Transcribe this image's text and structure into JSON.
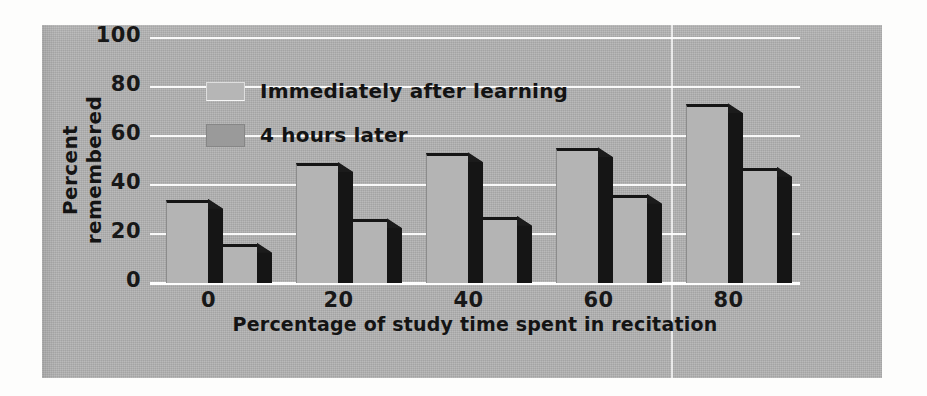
{
  "figure": {
    "background_color": "#b2b2b2",
    "page_color": "#fdfdfc"
  },
  "chart_data": {
    "type": "bar",
    "title": "",
    "xlabel": "Percentage of study time spent in recitation",
    "ylabel": "Percent remembered",
    "categories": [
      "0",
      "20",
      "40",
      "60",
      "80"
    ],
    "series": [
      {
        "name": "Immediately after learning",
        "values": [
          34,
          49,
          53,
          55,
          73
        ],
        "color": "#b4b4b4"
      },
      {
        "name": "4 hours later",
        "values": [
          16,
          26,
          27,
          36,
          47
        ],
        "color": "#b4b4b4"
      }
    ],
    "ylim": [
      0,
      100
    ],
    "yticks": [
      "0",
      "20",
      "40",
      "60",
      "80",
      "100"
    ],
    "ytick_values": [
      0,
      20,
      40,
      60,
      80,
      100
    ],
    "grid": true,
    "grid_color": "#ffffff",
    "legend_position": "upper left",
    "bar_style": "3d-extruded",
    "bar_shadow_color": "#151515"
  },
  "legend": {
    "entries": [
      {
        "label": "Immediately after learning",
        "swatch": "light"
      },
      {
        "label": "4 hours later",
        "swatch": "dark"
      }
    ]
  }
}
